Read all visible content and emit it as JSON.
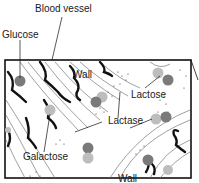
{
  "diagram": {
    "labels": {
      "blood_vessel": "Blood vessel",
      "glucose": "Glucose",
      "wall_top": "Wall",
      "lactose": "Lactose",
      "lactase": "Lactase",
      "galactose": "Galactose",
      "wall_bottom": "Wall"
    },
    "colors": {
      "glucose": "#7a7a7a",
      "galactose": "#bdbdbd",
      "outline": "#111111",
      "fold": "#666666"
    }
  }
}
